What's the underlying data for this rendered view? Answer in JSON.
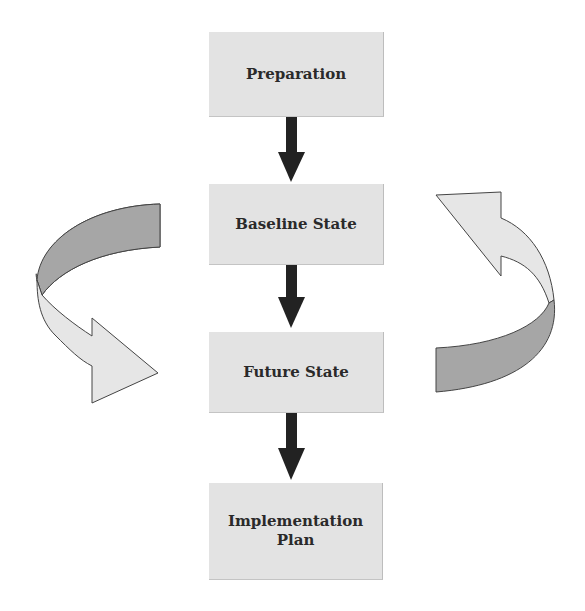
{
  "diagram": {
    "steps": [
      {
        "label": "Preparation"
      },
      {
        "label": "Baseline State"
      },
      {
        "label": "Future State"
      },
      {
        "label": "Implementation Plan"
      }
    ],
    "connectors": [
      "Preparation -> Baseline State",
      "Baseline State -> Future State",
      "Future State -> Implementation Plan"
    ],
    "cycle_arrows": [
      {
        "side": "left",
        "direction": "curving down toward Future State"
      },
      {
        "side": "right",
        "direction": "curving up toward Baseline State"
      }
    ],
    "colors": {
      "box_fill": "#e3e3e3",
      "arrow_dark": "#222222",
      "ribbon_dark": "#a6a6a6",
      "ribbon_light": "#e6e6e6"
    }
  }
}
